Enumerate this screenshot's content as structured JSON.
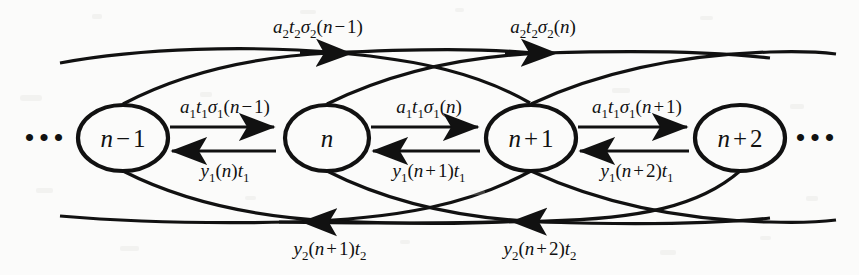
{
  "figure": {
    "name": "signal-flow-graph",
    "background_color": "#fbfbfa",
    "ink_color": "#111111",
    "width": 859,
    "height": 275
  },
  "ellipsis": {
    "left": "•••",
    "right": "•••"
  },
  "nodes": [
    {
      "id": "node-n-minus-1",
      "base": "n",
      "op": "−",
      "index": "1",
      "cx": 123,
      "cy": 138,
      "rx": 45,
      "ry": 33
    },
    {
      "id": "node-n",
      "base": "n",
      "op": "",
      "index": "",
      "cx": 327,
      "cy": 138,
      "rx": 42,
      "ry": 33
    },
    {
      "id": "node-n-plus-1",
      "base": "n",
      "op": "+",
      "index": "1",
      "cx": 531,
      "cy": 138,
      "rx": 45,
      "ry": 33
    },
    {
      "id": "node-n-plus-2",
      "base": "n",
      "op": "+",
      "index": "2",
      "cx": 740,
      "cy": 138,
      "rx": 45,
      "ry": 33
    }
  ],
  "forward_edges": [
    {
      "id": "forward-edge-1",
      "coef": "a",
      "coef_sub": "1",
      "tau": "t",
      "tau_sub": "1",
      "sigma": "σ",
      "sigma_sub": "1",
      "arg": "(n − 1)",
      "label_x": 225,
      "label_y": 113
    },
    {
      "id": "forward-edge-2",
      "coef": "a",
      "coef_sub": "1",
      "tau": "t",
      "tau_sub": "1",
      "sigma": "σ",
      "sigma_sub": "1",
      "arg": "(n)",
      "label_x": 429,
      "label_y": 113
    },
    {
      "id": "forward-edge-3",
      "coef": "a",
      "coef_sub": "1",
      "tau": "t",
      "tau_sub": "1",
      "sigma": "σ",
      "sigma_sub": "1",
      "arg": "(n + 1)",
      "label_x": 637,
      "label_y": 113
    }
  ],
  "backward_edges": [
    {
      "id": "backward-edge-1",
      "y": "y",
      "y_sub": "1",
      "arg": "(n)",
      "tau": "t",
      "tau_sub": "1",
      "label_x": 225,
      "label_y": 176
    },
    {
      "id": "backward-edge-2",
      "y": "y",
      "y_sub": "1",
      "arg": "(n + 1)",
      "tau": "t",
      "tau_sub": "1",
      "label_x": 429,
      "label_y": 176
    },
    {
      "id": "backward-edge-3",
      "y": "y",
      "y_sub": "1",
      "arg": "(n + 2)",
      "tau": "t",
      "tau_sub": "1",
      "label_x": 637,
      "label_y": 176
    }
  ],
  "long_forward_edges": [
    {
      "id": "long-forward-edge-1",
      "coef": "a",
      "coef_sub": "2",
      "tau": "t",
      "tau_sub": "2",
      "sigma": "σ",
      "sigma_sub": "2",
      "arg": "(n − 1)",
      "label_x": 318,
      "label_y": 33
    },
    {
      "id": "long-forward-edge-2",
      "coef": "a",
      "coef_sub": "2",
      "tau": "t",
      "tau_sub": "2",
      "sigma": "σ",
      "sigma_sub": "2",
      "arg": "(n)",
      "label_x": 543,
      "label_y": 33
    }
  ],
  "long_backward_edges": [
    {
      "id": "long-backward-edge-1",
      "y": "y",
      "y_sub": "2",
      "arg": "(n + 1)",
      "tau": "t",
      "tau_sub": "2",
      "label_x": 330,
      "label_y": 254
    },
    {
      "id": "long-backward-edge-2",
      "y": "y",
      "y_sub": "2",
      "arg": "(n + 2)",
      "tau": "t",
      "tau_sub": "2",
      "label_x": 540,
      "label_y": 254
    }
  ]
}
